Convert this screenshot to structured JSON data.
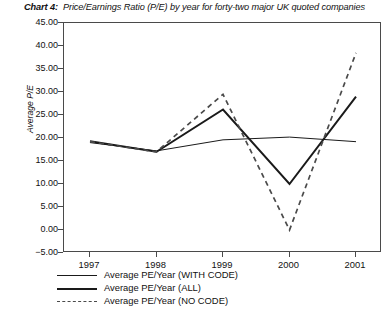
{
  "caption": {
    "label": "Chart 4:",
    "text": "Price/Earnings Ratio (P/E) by year for forty-two major UK quoted companies"
  },
  "footer": {
    "cut_off_text": ""
  },
  "chart_data": {
    "type": "line",
    "title": "Price/Earnings Ratio (P/E) by year for forty-two major UK quoted companies",
    "xlabel": "",
    "ylabel": "Average P/E",
    "categories": [
      "1997",
      "1998",
      "1999",
      "2000",
      "2001"
    ],
    "x_tick_labels": [
      "1997",
      "1998",
      "1999",
      "2000",
      "2001"
    ],
    "y_tick_labels": [
      "45.00",
      "40.00",
      "35.00",
      "30.00",
      "25.00",
      "20.00",
      "15.00",
      "10.00",
      "5.00",
      "0.00",
      "-5.00"
    ],
    "y_tick_values": [
      45,
      40,
      35,
      30,
      25,
      20,
      15,
      10,
      5,
      0,
      -5
    ],
    "ylim": [
      -5,
      45
    ],
    "grid": false,
    "legend_position": "below-axes-left",
    "series": [
      {
        "name": "Average PE/Year (WITH CODE)",
        "style": "solid-thin",
        "color": "#1a1a1a",
        "values": [
          19.0,
          17.2,
          19.6,
          20.2,
          19.2
        ]
      },
      {
        "name": "Average PE/Year (ALL)",
        "style": "solid-thick",
        "color": "#1a1a1a",
        "values": [
          19.3,
          17.0,
          26.2,
          10.0,
          29.0
        ]
      },
      {
        "name": "Average PE/Year (NO CODE)",
        "style": "dashed",
        "color": "#4a4a4a",
        "values": [
          19.2,
          17.0,
          29.5,
          0.0,
          38.5
        ]
      }
    ],
    "legend_entries": [
      "Average PE/Year (WITH CODE)",
      "Average PE/Year (ALL)",
      "Average PE/Year (NO CODE)"
    ]
  }
}
